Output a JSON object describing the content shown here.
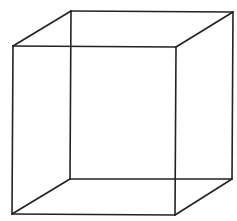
{
  "diagram": {
    "type": "wireframe-cube",
    "background": "#ffffff",
    "stroke_color": "#222222",
    "stroke_width": 1.6,
    "front_face": {
      "top_left": [
        13,
        46
      ],
      "top_right": [
        176,
        47
      ],
      "bottom_right": [
        175,
        215
      ],
      "bottom_left": [
        12,
        214
      ]
    },
    "back_face": {
      "top_left": [
        71,
        11
      ],
      "top_right": [
        233,
        12
      ],
      "bottom_right": [
        232,
        179
      ],
      "bottom_left": [
        70,
        179
      ]
    }
  }
}
